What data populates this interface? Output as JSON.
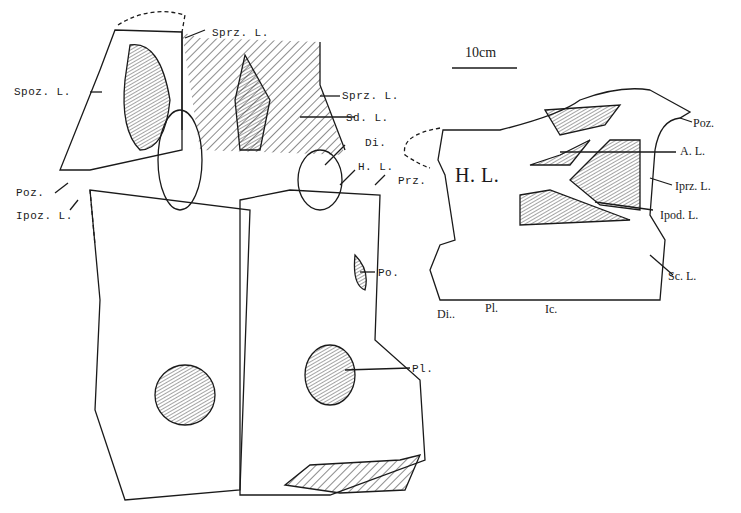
{
  "scale_bar": {
    "label": "10cm"
  },
  "left_view": {
    "labels": {
      "sprz_top": "Sprz. L.",
      "spoz": "Spoz. L.",
      "sprz_mid": "Sprz. L.",
      "sd": "Sd. L.",
      "di": "Di.",
      "hl": "H. L.",
      "prz": "Prz.",
      "poz": "Poz.",
      "ipoz": "Ipoz. L.",
      "po": "Po.",
      "pl": "Pl."
    }
  },
  "right_view": {
    "labels": {
      "hl_big": "H. L.",
      "poz": "Poz.",
      "al": "A. L.",
      "iprz": "Iprz. L.",
      "ipod": "Ipod. L.",
      "sc": "Sc. L.",
      "di": "Di..",
      "pl": "Pl.",
      "ic": "Ic."
    }
  },
  "colors": {
    "ink": "#1a1a1a",
    "paper": "#ffffff"
  }
}
